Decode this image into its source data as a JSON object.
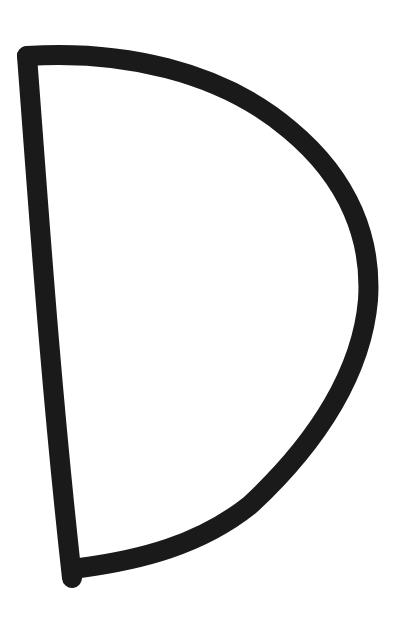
{
  "image": {
    "subject": "hand-drawn letter D",
    "letter": "D",
    "width": 408,
    "height": 632,
    "background": "#ffffff",
    "ink_color": "#1a1a1a",
    "stroke_width": 20,
    "stem_path": "M27 56 C 38 200, 50 380, 72 578",
    "bowl_path": "M27 56 C 120 50, 220 70, 290 130 C 350 180, 372 240, 368 300 C 362 370, 320 440, 250 505 C 200 545, 140 560, 80 568"
  }
}
